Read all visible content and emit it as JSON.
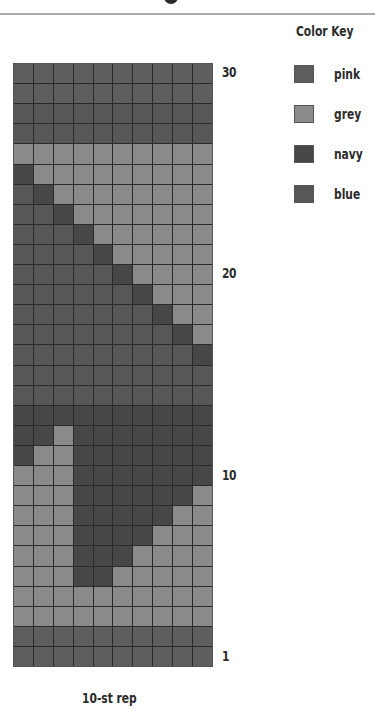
{
  "header": {
    "rule_color": "#a9a9a9"
  },
  "color_key": {
    "title": "Color Key",
    "items": [
      {
        "code": "P",
        "label": "pink",
        "color": "#5e5e5e"
      },
      {
        "code": "G",
        "label": "grey",
        "color": "#8a8a8a"
      },
      {
        "code": "N",
        "label": "navy",
        "color": "#474747"
      },
      {
        "code": "B",
        "label": "blue",
        "color": "#575757"
      }
    ]
  },
  "chart": {
    "columns": 10,
    "rows": 30,
    "row_labels": [
      {
        "row": 30,
        "text": "30"
      },
      {
        "row": 20,
        "text": "20"
      },
      {
        "row": 10,
        "text": "10"
      },
      {
        "row": 1,
        "text": "1"
      }
    ],
    "repeat_label": "10-st rep",
    "rows_top_to_bottom": [
      {
        "row": 30,
        "cells": "PPPPPPPPPP"
      },
      {
        "row": 29,
        "cells": "PPPPPPPPPP"
      },
      {
        "row": 28,
        "cells": "BBBBBBBBBB"
      },
      {
        "row": 27,
        "cells": "BBBBBBBBBB"
      },
      {
        "row": 26,
        "cells": "GGGGGGGGGG"
      },
      {
        "row": 25,
        "cells": "NGGGGGGGGG"
      },
      {
        "row": 24,
        "cells": "BNGGGGGGGG"
      },
      {
        "row": 23,
        "cells": "BBNGGGGGGG"
      },
      {
        "row": 22,
        "cells": "BBBNGGGGGG"
      },
      {
        "row": 21,
        "cells": "BBBBNGGGGG"
      },
      {
        "row": 20,
        "cells": "BBBBBNGGGG"
      },
      {
        "row": 19,
        "cells": "BBBBBBNGGG"
      },
      {
        "row": 18,
        "cells": "BBBBBBBNGG"
      },
      {
        "row": 17,
        "cells": "BBBBBBBBNG"
      },
      {
        "row": 16,
        "cells": "BBBBBBBBBN"
      },
      {
        "row": 15,
        "cells": "BBBBBBBBBB"
      },
      {
        "row": 14,
        "cells": "BBBBBBBBBB"
      },
      {
        "row": 13,
        "cells": "NNNNNNNNNN"
      },
      {
        "row": 12,
        "cells": "NNGNNNNNNN"
      },
      {
        "row": 11,
        "cells": "NGGNNNNNNN"
      },
      {
        "row": 10,
        "cells": "GGGNNNNNNN"
      },
      {
        "row": 9,
        "cells": "GGGNNNNNNG"
      },
      {
        "row": 8,
        "cells": "GGGNNNNNGG"
      },
      {
        "row": 7,
        "cells": "GGGNNNNGGG"
      },
      {
        "row": 6,
        "cells": "GGGNNNGGGG"
      },
      {
        "row": 5,
        "cells": "GGGNNGGGGG"
      },
      {
        "row": 4,
        "cells": "GGGGGGGGGG"
      },
      {
        "row": 3,
        "cells": "GGGGGGGGGG"
      },
      {
        "row": 2,
        "cells": "PPPPPPPPPP"
      },
      {
        "row": 1,
        "cells": "PPPPPPPPPP"
      }
    ]
  }
}
